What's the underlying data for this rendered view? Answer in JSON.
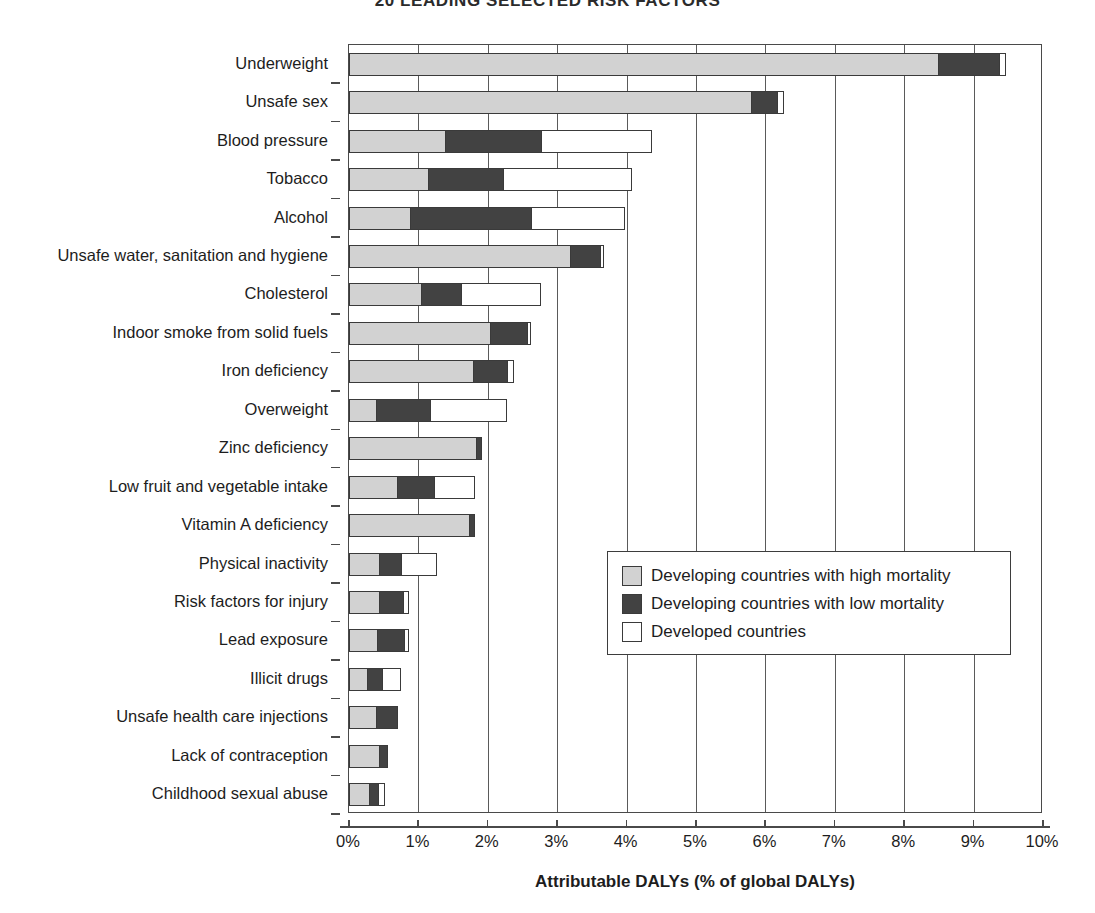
{
  "chart_data": {
    "type": "bar",
    "orientation": "horizontal",
    "stacked": true,
    "title": "20 LEADING SELECTED RISK FACTORS",
    "xlabel": "Attributable DALYs (% of global DALYs)",
    "ylabel": "",
    "xlim": [
      0,
      10
    ],
    "xtick_labels": [
      "0%",
      "1%",
      "2%",
      "3%",
      "4%",
      "5%",
      "6%",
      "7%",
      "8%",
      "9%",
      "10%"
    ],
    "xtick_values": [
      0,
      1,
      2,
      3,
      4,
      5,
      6,
      7,
      8,
      9,
      10
    ],
    "grid": true,
    "legend_position": "center-right",
    "categories": [
      "Underweight",
      "Unsafe sex",
      "Blood pressure",
      "Tobacco",
      "Alcohol",
      "Unsafe water, sanitation and hygiene",
      "Cholesterol",
      "Indoor smoke from solid fuels",
      "Iron deficiency",
      "Overweight",
      "Zinc deficiency",
      "Low fruit and vegetable intake",
      "Vitamin A deficiency",
      "Physical inactivity",
      "Risk factors for injury",
      "Lead exposure",
      "Illicit drugs",
      "Unsafe health care injections",
      "Lack of contraception",
      "Childhood sexual abuse"
    ],
    "series": [
      {
        "name": "Developing countries with high mortality",
        "color": "#d2d2d2",
        "values": [
          8.5,
          5.8,
          1.4,
          1.15,
          0.9,
          3.2,
          1.05,
          2.05,
          1.8,
          0.4,
          1.85,
          0.7,
          1.75,
          0.45,
          0.45,
          0.42,
          0.28,
          0.4,
          0.45,
          0.3
        ]
      },
      {
        "name": "Developing countries with low mortality",
        "color": "#424242",
        "values": [
          0.9,
          0.4,
          1.4,
          1.1,
          1.75,
          0.45,
          0.6,
          0.55,
          0.5,
          0.8,
          0.08,
          0.55,
          0.08,
          0.33,
          0.35,
          0.4,
          0.22,
          0.32,
          0.12,
          0.15
        ]
      },
      {
        "name": "Developed countries",
        "color": "#ffffff",
        "values": [
          0.1,
          0.1,
          1.6,
          1.85,
          1.35,
          0.05,
          1.15,
          0.05,
          0.1,
          1.1,
          0.0,
          0.6,
          0.0,
          0.52,
          0.1,
          0.08,
          0.28,
          0.0,
          0.0,
          0.1
        ]
      }
    ],
    "totals": [
      9.5,
      6.3,
      4.4,
      4.1,
      4.0,
      3.7,
      2.8,
      2.65,
      2.4,
      2.3,
      1.93,
      1.85,
      1.83,
      1.3,
      0.9,
      0.9,
      0.78,
      0.72,
      0.57,
      0.55
    ]
  },
  "legend": {
    "items": [
      {
        "label": "Developing countries with high mortality",
        "swatch": "light-gray"
      },
      {
        "label": "Developing countries with low mortality",
        "swatch": "dark-gray"
      },
      {
        "label": "Developed countries",
        "swatch": "white"
      }
    ]
  }
}
